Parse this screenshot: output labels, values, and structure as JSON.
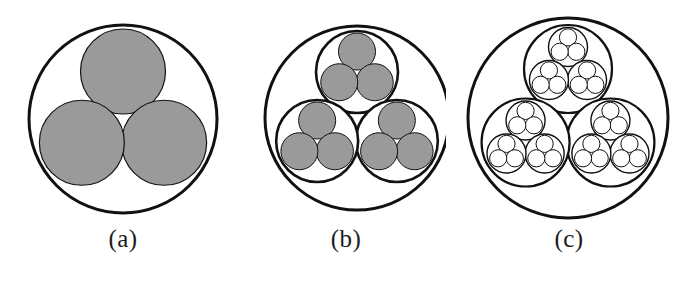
{
  "figure": {
    "background_color": "#ffffff",
    "width": 692,
    "height": 282,
    "stroke_color": "#111111",
    "fill_gray": "#9a9a9a",
    "fill_white": "#ffffff"
  },
  "panels": [
    {
      "id": "a",
      "label": "(a)",
      "levels": 1,
      "description": "One outer circle containing three gray filled circles",
      "outer": {
        "cx": 123,
        "cy": 119,
        "r": 94,
        "stroke_width": 3.0,
        "fill": "#ffffff"
      },
      "level1": {
        "r": 42.5,
        "offset": 47.5,
        "fill": "#9a9a9a",
        "stroke_width": 1.2
      },
      "label_x": 123,
      "label_y": 240
    },
    {
      "id": "b",
      "label": "(b)",
      "levels": 2,
      "description": "One outer circle containing three sub-circles, each containing three gray filled circles",
      "outer": {
        "cx": 357,
        "cy": 118,
        "r": 92,
        "stroke_width": 3.0,
        "fill": "#ffffff"
      },
      "level1": {
        "r": 41,
        "offset": 46,
        "fill": "#ffffff",
        "stroke_width": 2.6
      },
      "level2": {
        "r": 18.5,
        "offset": 20.5,
        "fill": "#9a9a9a",
        "stroke_width": 1.0
      },
      "label_x": 360,
      "label_y": 240
    },
    {
      "id": "c",
      "label": "(c)",
      "levels": 3,
      "description": "One outer circle containing three sub-circles, each containing three sub-sub-circles, each containing three small outlined circles",
      "outer": {
        "cx": 568,
        "cy": 118,
        "r": 100,
        "stroke_width": 3.0,
        "fill": "#ffffff"
      },
      "level1": {
        "r": 44,
        "offset": 49,
        "fill": "#ffffff",
        "stroke_width": 2.2
      },
      "level2": {
        "r": 19.5,
        "offset": 22,
        "fill": "#ffffff",
        "stroke_width": 1.4
      },
      "level3": {
        "r": 8.6,
        "offset": 9.6,
        "fill": "#ffffff",
        "stroke_width": 1.0
      },
      "label_x": 577,
      "label_y": 240
    }
  ],
  "geometry": {
    "child_count": 3,
    "child_angles_deg": [
      -90,
      30,
      150
    ],
    "note": "Three children arranged at 120 degree intervals with one child at the top"
  }
}
